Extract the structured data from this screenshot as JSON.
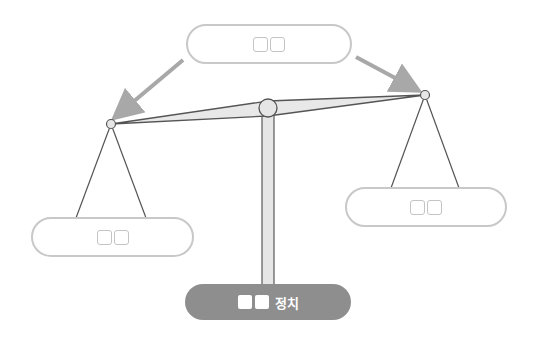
{
  "diagram": {
    "top_box": {
      "label_placeholder": "□□"
    },
    "left_box": {
      "label_placeholder": "□□"
    },
    "right_box": {
      "label_placeholder": "□□"
    },
    "base_label": {
      "placeholder": "□□",
      "text": "정치"
    },
    "colors": {
      "box_border": "#c8c8c8",
      "arrow": "#a8a8a8",
      "beam_fill": "#e8e8e8",
      "beam_stroke": "#555555",
      "base_fill": "#8e8e8e"
    }
  }
}
